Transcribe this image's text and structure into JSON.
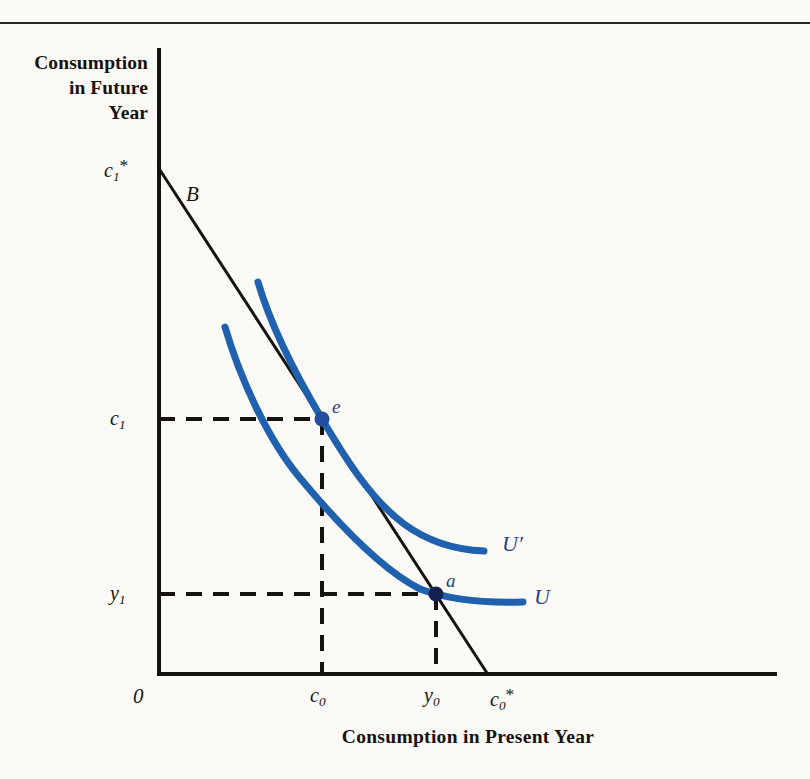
{
  "figure": {
    "background_color": "#fbfaf7",
    "axis_color": "#16120f",
    "curve_color": "#1f61ae",
    "label_color": "#1f3f8f",
    "axes": {
      "y_title": [
        "Consumption",
        "in Future",
        "Year"
      ],
      "x_title": "Consumption in Present Year",
      "origin_label": "0"
    },
    "y_ticks": [
      {
        "id": "c1star",
        "base": "c",
        "sub": "1",
        "star": "*",
        "y": 167
      },
      {
        "id": "c1",
        "base": "c",
        "sub": "1",
        "star": "",
        "y": 419
      },
      {
        "id": "y1",
        "base": "y",
        "sub": "1",
        "star": "",
        "y": 594
      }
    ],
    "x_ticks": [
      {
        "id": "c0",
        "base": "c",
        "sub": "0",
        "star": "",
        "x": 322
      },
      {
        "id": "y0",
        "base": "y",
        "sub": "0",
        "star": "",
        "x": 436
      },
      {
        "id": "c0star",
        "base": "c",
        "sub": "0",
        "star": "*",
        "x": 487
      }
    ],
    "budget_line": {
      "label": "B",
      "from": [
        158,
        167
      ],
      "to": [
        487,
        673
      ]
    },
    "curves": [
      {
        "name": "U-prime",
        "label": "U′",
        "description": "higher indifference curve tangent to budget line at e",
        "path": [
          [
            258,
            282
          ],
          [
            285,
            355
          ],
          [
            322,
            419
          ],
          [
            380,
            495
          ],
          [
            440,
            537
          ],
          [
            484,
            551
          ]
        ]
      },
      {
        "name": "U",
        "label": "U",
        "description": "lower indifference curve through endowment point a",
        "path": [
          [
            225,
            327
          ],
          [
            255,
            402
          ],
          [
            300,
            478
          ],
          [
            360,
            548
          ],
          [
            420,
            589
          ],
          [
            470,
            600
          ],
          [
            523,
            602
          ]
        ]
      }
    ],
    "points": [
      {
        "id": "e",
        "label": "e",
        "x": 322,
        "y": 419,
        "description": "optimum consumption bundle"
      },
      {
        "id": "a",
        "label": "a",
        "x": 436,
        "y": 594,
        "description": "endowment point"
      }
    ]
  }
}
